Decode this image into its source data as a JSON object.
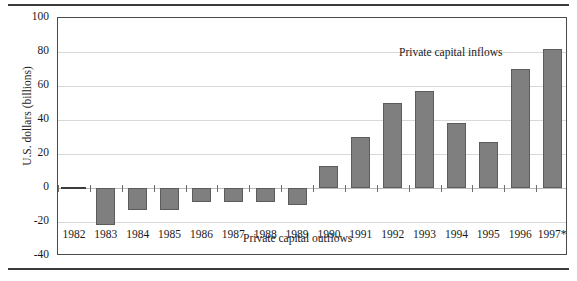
{
  "chart_data": {
    "type": "bar",
    "title": "",
    "xlabel": "",
    "ylabel": "U.S. dollars (billions)",
    "categories": [
      "1982",
      "1983",
      "1984",
      "1985",
      "1986",
      "1987",
      "1988",
      "1989",
      "1990",
      "1991",
      "1992",
      "1993",
      "1994",
      "1995",
      "1996",
      "1997*"
    ],
    "values": [
      0,
      -22,
      -13,
      -13,
      -8,
      -8,
      -8,
      -10,
      13,
      30,
      50,
      57,
      38,
      27,
      70,
      82
    ],
    "ylim": [
      -40,
      100
    ],
    "yticks": [
      -40,
      -20,
      0,
      20,
      40,
      60,
      80,
      100
    ],
    "ytick_labels": [
      "-40",
      "-20",
      "0",
      "20",
      "40",
      "60",
      "80",
      "100"
    ],
    "grid": true,
    "legend": "none",
    "annotations": [
      {
        "text": "Private capital inflows",
        "region": "upper-right"
      },
      {
        "text": "Private capital outflows",
        "region": "lower-left"
      }
    ],
    "bar_color": "#7f7f7f",
    "bar_edge_color": "#5c5c5c",
    "grid_color": "#d9d9d9",
    "axis_color": "#4a4a4a",
    "background": "#ffffff"
  }
}
